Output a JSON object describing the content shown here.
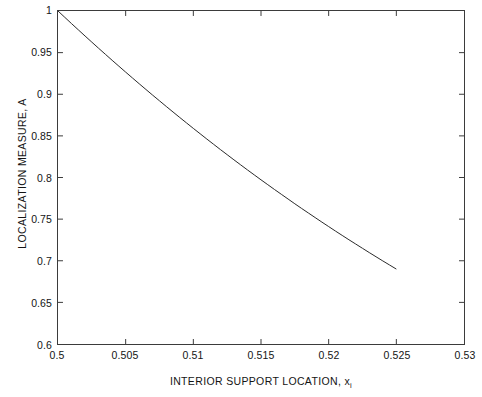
{
  "chart_data": {
    "type": "line",
    "title": "",
    "subtitle": "",
    "xlabel_main": "INTERIOR SUPPORT LOCATION, x",
    "xlabel_subscript": "i",
    "ylabel": "LOCALIZATION MEASURE, A",
    "xlim": [
      0.5,
      0.53
    ],
    "ylim": [
      0.6,
      1.0
    ],
    "xticks": [
      0.5,
      0.505,
      0.51,
      0.515,
      0.52,
      0.525,
      0.53
    ],
    "xtick_labels": [
      "0.5",
      "0.505",
      "0.51",
      "0.515",
      "0.52",
      "0.525",
      "0.53"
    ],
    "yticks": [
      0.6,
      0.65,
      0.7,
      0.75,
      0.8,
      0.85,
      0.9,
      0.95,
      1.0
    ],
    "ytick_labels": [
      "0.6",
      "0.65",
      "0.7",
      "0.75",
      "0.8",
      "0.85",
      "0.9",
      "0.95",
      "1"
    ],
    "grid": false,
    "legend": null,
    "line_color": "#2b2b2b",
    "line_width": 1.0,
    "axes_color": "#3b3b3b",
    "background_color": "#ffffff",
    "series": [
      {
        "name": "localization measure",
        "x": [
          0.5,
          0.5005,
          0.501,
          0.5015,
          0.502,
          0.5025,
          0.503,
          0.5035,
          0.504,
          0.5045,
          0.505,
          0.5055,
          0.506,
          0.5065,
          0.507,
          0.5075,
          0.508,
          0.5085,
          0.509,
          0.5095,
          0.51,
          0.5105,
          0.511,
          0.5115,
          0.512,
          0.5125,
          0.513,
          0.5135,
          0.514,
          0.5145,
          0.515,
          0.5155,
          0.516,
          0.5165,
          0.517,
          0.5175,
          0.518,
          0.5185,
          0.519,
          0.5195,
          0.52,
          0.5205,
          0.521,
          0.5215,
          0.522,
          0.5225,
          0.523,
          0.5235,
          0.524,
          0.5245,
          0.525
        ],
        "y": [
          1.0,
          0.9935,
          0.987,
          0.9806,
          0.9742,
          0.9679,
          0.9616,
          0.9554,
          0.9492,
          0.9431,
          0.937,
          0.931,
          0.925,
          0.9191,
          0.9132,
          0.9074,
          0.9016,
          0.8959,
          0.8902,
          0.8846,
          0.879,
          0.8735,
          0.868,
          0.8626,
          0.8572,
          0.8519,
          0.8466,
          0.8414,
          0.8362,
          0.8311,
          0.826,
          0.821,
          0.816,
          0.8111,
          0.8062,
          0.8013,
          0.7965,
          0.7918,
          0.7871,
          0.7824,
          0.7778,
          0.7732,
          0.7687,
          0.7642,
          0.7598,
          0.7554,
          0.751,
          0.7467,
          0.7424,
          0.7382,
          0.734
        ],
        "comment_endpoint": "curve terminates at x=0.525, y=0.69"
      }
    ],
    "curve_endpoints": {
      "start": {
        "x": 0.5,
        "y": 1.0
      },
      "end": {
        "x": 0.525,
        "y": 0.69
      }
    }
  },
  "figure": {
    "canvas_width": 482,
    "canvas_height": 397
  }
}
